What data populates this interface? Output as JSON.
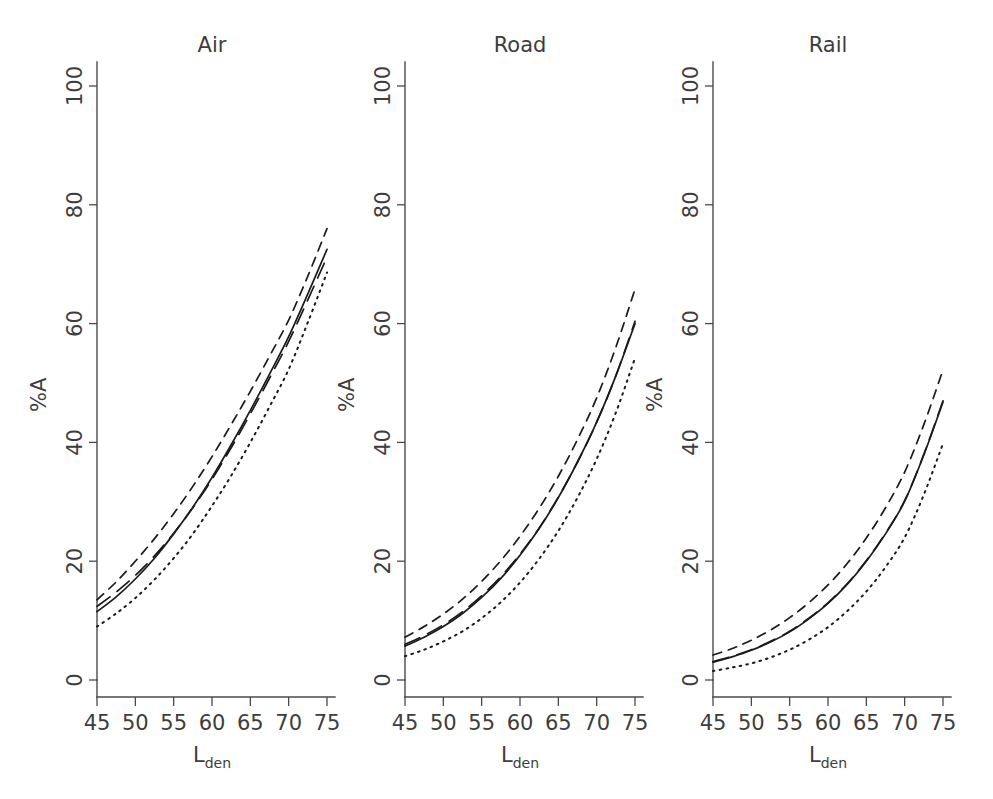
{
  "figure": {
    "width": 993,
    "height": 799,
    "background": "#ffffff",
    "ink_color": "#1a1a1a",
    "axis_color": "#4a4a4a",
    "text_color": "#3d3d3d"
  },
  "chart_data": {
    "type": "line",
    "title": "",
    "subtitle": "",
    "xlabel": "Lden",
    "xlabel_base": "L",
    "xlabel_sub": "den",
    "ylabel": "%A",
    "xlim": [
      43,
      77
    ],
    "ylim": [
      0,
      105
    ],
    "xticks": [
      45,
      50,
      55,
      60,
      65,
      70,
      75
    ],
    "xtick_labels": [
      "45",
      "50",
      "55",
      "60",
      "65",
      "70",
      "75"
    ],
    "yticks": [
      0,
      20,
      40,
      60,
      80,
      100
    ],
    "ytick_labels": [
      "0",
      "20",
      "40",
      "60",
      "80",
      "100"
    ],
    "grid": false,
    "legend": "none",
    "x": [
      45,
      47.5,
      50,
      52.5,
      55,
      57.5,
      60,
      62.5,
      65,
      67.5,
      70,
      72.5,
      75
    ],
    "panels": [
      {
        "id": "air",
        "title": "Air",
        "series": [
          {
            "name": "dashed-upper",
            "line_style": "dashed",
            "values": [
              13.5,
              16.5,
              20.0,
              23.8,
              28.0,
              32.6,
              37.6,
              43.0,
              48.6,
              54.5,
              60.6,
              68.0,
              76.0
            ]
          },
          {
            "name": "long-dashed",
            "line_style": "longdash",
            "values": [
              12.4,
              14.8,
              17.6,
              20.9,
              24.7,
              29.0,
              33.8,
              39.1,
              44.8,
              50.8,
              57.0,
              64.0,
              71.2
            ]
          },
          {
            "name": "solid",
            "line_style": "solid",
            "values": [
              11.5,
              14.0,
              17.0,
              20.5,
              24.6,
              29.1,
              34.1,
              39.6,
              45.4,
              51.5,
              57.8,
              65.0,
              72.5
            ]
          },
          {
            "name": "dotted-lower",
            "line_style": "dotted",
            "values": [
              9.0,
              11.2,
              13.8,
              16.9,
              20.5,
              24.6,
              29.3,
              34.4,
              40.0,
              46.0,
              52.3,
              60.2,
              68.6
            ]
          }
        ]
      },
      {
        "id": "road",
        "title": "Road",
        "series": [
          {
            "name": "dashed-upper",
            "line_style": "dashed",
            "values": [
              7.2,
              9.0,
              11.1,
              13.6,
              16.6,
              20.1,
              24.2,
              28.9,
              34.3,
              40.5,
              47.5,
              56.0,
              65.8
            ]
          },
          {
            "name": "long-dashed",
            "line_style": "longdash",
            "values": [
              6.0,
              7.5,
              9.3,
              11.5,
              14.2,
              17.4,
              21.2,
              25.6,
              30.8,
              36.7,
              43.4,
              51.2,
              60.4
            ]
          },
          {
            "name": "solid",
            "line_style": "solid",
            "values": [
              5.7,
              7.2,
              9.0,
              11.2,
              13.9,
              17.1,
              21.0,
              25.5,
              30.7,
              36.7,
              43.4,
              51.2,
              60.0
            ]
          },
          {
            "name": "dotted-lower",
            "line_style": "dotted",
            "values": [
              4.0,
              5.1,
              6.5,
              8.2,
              10.4,
              13.1,
              16.4,
              20.4,
              25.1,
              30.7,
              37.2,
              45.0,
              54.2
            ]
          }
        ]
      },
      {
        "id": "rail",
        "title": "Rail",
        "series": [
          {
            "name": "dashed-upper",
            "line_style": "dashed",
            "values": [
              4.2,
              5.3,
              6.7,
              8.4,
              10.5,
              13.0,
              16.0,
              19.6,
              23.9,
              29.0,
              35.0,
              43.0,
              52.2
            ]
          },
          {
            "name": "long-dashed",
            "line_style": "longdash",
            "values": [
              3.1,
              4.0,
              5.1,
              6.5,
              8.2,
              10.4,
              13.0,
              16.2,
              20.1,
              24.7,
              30.2,
              38.0,
              47.0
            ]
          },
          {
            "name": "solid",
            "line_style": "solid",
            "values": [
              3.0,
              3.9,
              5.0,
              6.4,
              8.1,
              10.3,
              12.9,
              16.1,
              20.0,
              24.6,
              30.1,
              37.9,
              46.8
            ]
          },
          {
            "name": "dotted-lower",
            "line_style": "dotted",
            "values": [
              1.5,
              2.1,
              2.8,
              3.8,
              5.1,
              6.8,
              8.9,
              11.6,
              14.9,
              19.0,
              24.0,
              31.2,
              39.8
            ]
          }
        ]
      }
    ]
  }
}
